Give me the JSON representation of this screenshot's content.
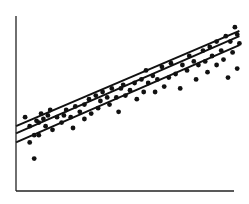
{
  "chart_data": {
    "type": "scatter",
    "title": "",
    "xlabel": "",
    "ylabel": "",
    "grid": false,
    "legend": null,
    "axes": {
      "origin_px": [
        16,
        191
      ],
      "x_end_px": [
        234,
        191
      ],
      "y_top_px": [
        16,
        16
      ]
    },
    "xlim": [
      0,
      100
    ],
    "ylim": [
      0,
      100
    ],
    "points": [
      [
        4,
        41
      ],
      [
        6,
        36
      ],
      [
        6,
        27
      ],
      [
        8,
        31
      ],
      [
        8,
        18
      ],
      [
        9,
        39
      ],
      [
        10,
        38
      ],
      [
        10,
        31
      ],
      [
        11,
        43
      ],
      [
        12,
        40
      ],
      [
        13,
        36
      ],
      [
        14,
        42
      ],
      [
        15,
        45
      ],
      [
        16,
        34
      ],
      [
        18,
        41
      ],
      [
        20,
        38
      ],
      [
        21,
        42
      ],
      [
        22,
        45
      ],
      [
        24,
        41
      ],
      [
        25,
        35
      ],
      [
        26,
        47
      ],
      [
        28,
        44
      ],
      [
        30,
        48
      ],
      [
        30,
        40
      ],
      [
        32,
        51
      ],
      [
        33,
        43
      ],
      [
        35,
        53
      ],
      [
        36,
        46
      ],
      [
        37,
        50
      ],
      [
        38,
        55
      ],
      [
        40,
        52
      ],
      [
        41,
        48
      ],
      [
        42,
        57
      ],
      [
        44,
        52
      ],
      [
        45,
        44
      ],
      [
        46,
        57
      ],
      [
        47,
        59
      ],
      [
        48,
        53
      ],
      [
        50,
        56
      ],
      [
        52,
        60
      ],
      [
        53,
        51
      ],
      [
        55,
        62
      ],
      [
        56,
        55
      ],
      [
        57,
        67
      ],
      [
        58,
        60
      ],
      [
        60,
        64
      ],
      [
        61,
        55
      ],
      [
        62,
        62
      ],
      [
        64,
        69
      ],
      [
        65,
        58
      ],
      [
        67,
        63
      ],
      [
        68,
        71
      ],
      [
        70,
        65
      ],
      [
        72,
        57
      ],
      [
        73,
        70
      ],
      [
        75,
        67
      ],
      [
        76,
        75
      ],
      [
        78,
        72
      ],
      [
        79,
        62
      ],
      [
        80,
        70
      ],
      [
        82,
        78
      ],
      [
        83,
        72
      ],
      [
        84,
        66
      ],
      [
        85,
        80
      ],
      [
        86,
        75
      ],
      [
        88,
        83
      ],
      [
        88,
        70
      ],
      [
        90,
        78
      ],
      [
        91,
        73
      ],
      [
        92,
        86
      ],
      [
        93,
        63
      ],
      [
        94,
        83
      ],
      [
        95,
        77
      ],
      [
        96,
        91
      ],
      [
        97,
        87
      ],
      [
        97,
        68
      ],
      [
        98,
        82
      ]
    ],
    "lines": [
      {
        "name": "upper-band",
        "x": [
          0,
          98
        ],
        "y": [
          36,
          89
        ]
      },
      {
        "name": "regression-line",
        "x": [
          0,
          98
        ],
        "y": [
          32,
          86
        ]
      },
      {
        "name": "lower-band",
        "x": [
          0,
          98
        ],
        "y": [
          27,
          81
        ]
      }
    ]
  }
}
